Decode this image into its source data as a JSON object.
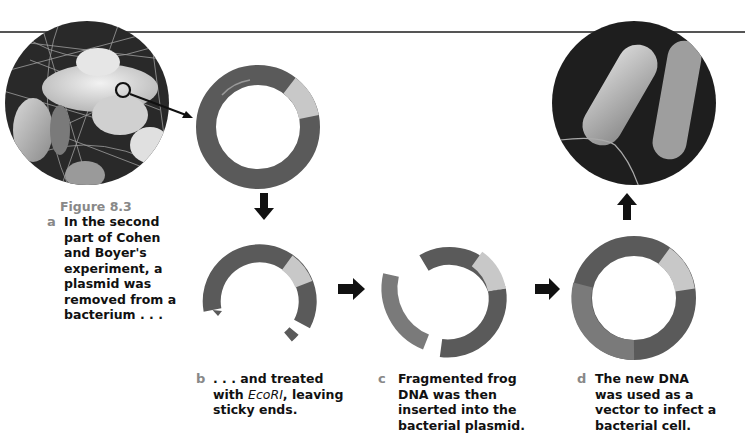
{
  "figure": {
    "title": "Figure 8.3",
    "steps": [
      {
        "letter": "a",
        "text_lines": [
          "In the second",
          "part of Cohen",
          "and Boyer's",
          "experiment, a",
          "plasmid was",
          "removed from a",
          "bacterium . . ."
        ]
      },
      {
        "letter": "b",
        "text_lines": [
          ". . . and treated",
          "with ",
          "EcoRI",
          ", leaving",
          "sticky ends."
        ]
      },
      {
        "letter": "c",
        "text_lines": [
          "Fragmented frog",
          "DNA was then",
          "inserted into the",
          "bacterial plasmid."
        ]
      },
      {
        "letter": "d",
        "text_lines": [
          "The new DNA",
          "was used as a",
          "vector to infect a",
          "bacterial cell."
        ]
      }
    ]
  },
  "illustrations": {
    "photo_left": "bacteria-micrograph-cluster",
    "photo_right": "bacterium-micrograph-single",
    "plasmid_colors": {
      "ring": "#5a5a5a",
      "insert_segment": "#c8c8c8",
      "frog_dna": "#7a7a7a"
    },
    "arrows": [
      "down-arrow",
      "right-arrow",
      "right-arrow",
      "up-arrow"
    ]
  }
}
